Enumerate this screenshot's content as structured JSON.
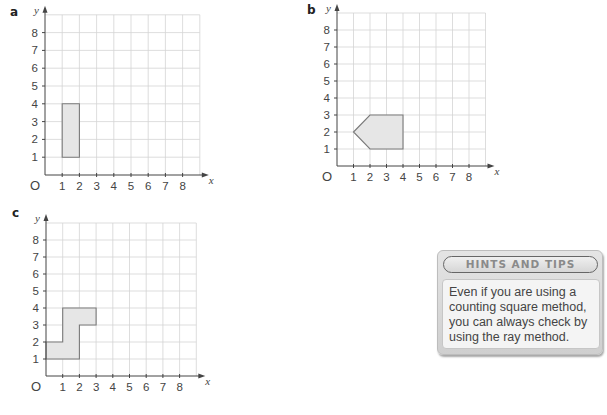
{
  "graphs": [
    {
      "id": "a",
      "label": "a",
      "label_pos": [
        10,
        6
      ],
      "origin_px": [
        45,
        175
      ],
      "unit_px": [
        17.2,
        17.8
      ],
      "grid": [
        9,
        9
      ],
      "x_ticks": [
        "1",
        "2",
        "3",
        "4",
        "5",
        "6",
        "7",
        "8"
      ],
      "y_ticks": [
        "1",
        "2",
        "3",
        "4",
        "5",
        "6",
        "7",
        "8"
      ],
      "x_axis_name": "x",
      "y_axis_name": "y",
      "origin_label": "O",
      "shape_vertices": [
        [
          1,
          1
        ],
        [
          2,
          1
        ],
        [
          2,
          4
        ],
        [
          1,
          4
        ]
      ]
    },
    {
      "id": "b",
      "label": "b",
      "label_pos": [
        307,
        4
      ],
      "origin_px": [
        337,
        166
      ],
      "unit_px": [
        16.5,
        17
      ],
      "grid": [
        9,
        9
      ],
      "x_ticks": [
        "1",
        "2",
        "3",
        "4",
        "5",
        "6",
        "7",
        "8"
      ],
      "y_ticks": [
        "1",
        "2",
        "3",
        "4",
        "5",
        "6",
        "7",
        "8"
      ],
      "x_axis_name": "x",
      "y_axis_name": "y",
      "origin_label": "O",
      "shape_vertices": [
        [
          1,
          2
        ],
        [
          2,
          3
        ],
        [
          4,
          3
        ],
        [
          4,
          1
        ],
        [
          2,
          1
        ]
      ]
    },
    {
      "id": "c",
      "label": "c",
      "label_pos": [
        12,
        207
      ],
      "origin_px": [
        46,
        376
      ],
      "unit_px": [
        16.7,
        17
      ],
      "grid": [
        9,
        9
      ],
      "x_ticks": [
        "1",
        "2",
        "3",
        "4",
        "5",
        "6",
        "7",
        "8"
      ],
      "y_ticks": [
        "1",
        "2",
        "3",
        "4",
        "5",
        "6",
        "7",
        "8"
      ],
      "x_axis_name": "x",
      "y_axis_name": "y",
      "origin_label": "O",
      "shape_vertices": [
        [
          0,
          1
        ],
        [
          2,
          1
        ],
        [
          2,
          3
        ],
        [
          3,
          3
        ],
        [
          3,
          4
        ],
        [
          1,
          4
        ],
        [
          1,
          2
        ],
        [
          0,
          2
        ]
      ]
    }
  ],
  "hints": {
    "title": "HINTS AND TIPS",
    "body": "Even if you are using a counting square method, you can always check by using the ray method."
  },
  "colors": {
    "shape_fill": "#e6e6e6",
    "shape_stroke": "#7a7a7a",
    "grid": "#d4d4d4",
    "axis": "#444444"
  }
}
